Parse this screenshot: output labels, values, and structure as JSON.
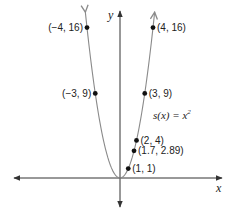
{
  "chart_data": {
    "type": "line",
    "title": "",
    "function_label": "s(x) = x²",
    "function_label_parts": {
      "lhs": "s(x) = x",
      "exp": "2"
    },
    "xlabel": "x",
    "ylabel": "y",
    "grid": false,
    "xlim": [
      -14,
      12.5
    ],
    "ylim": [
      -3,
      17.5
    ],
    "curve": {
      "expression": "x^2",
      "x_range": [
        -4.2,
        4.2
      ],
      "color": "#8a8a8a"
    },
    "points": [
      {
        "x": -4,
        "y": 16,
        "label": "(−4, 16)",
        "label_side": "left"
      },
      {
        "x": -3,
        "y": 9,
        "label": "(−3, 9)",
        "label_side": "left"
      },
      {
        "x": 4,
        "y": 16,
        "label": "(4, 16)",
        "label_side": "right"
      },
      {
        "x": 3,
        "y": 9,
        "label": "(3, 9)",
        "label_side": "right"
      },
      {
        "x": 2,
        "y": 4,
        "label": "(2, 4)",
        "label_side": "right"
      },
      {
        "x": 1.7,
        "y": 2.89,
        "label": "(1.7, 2.89)",
        "label_side": "right"
      },
      {
        "x": 1,
        "y": 1,
        "label": "(1, 1)",
        "label_side": "right"
      }
    ],
    "colors": {
      "axis": "#333333",
      "curve": "#8a8a8a",
      "point": "#111111",
      "text": "#222222"
    }
  }
}
